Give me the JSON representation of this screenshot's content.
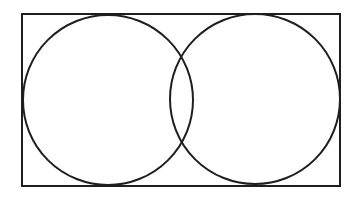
{
  "diagram": {
    "type": "venn",
    "stroke_color": "#1e1e1e",
    "background": "#ffffff",
    "frame": {
      "x": 22,
      "y": 14,
      "width": 318,
      "height": 172
    },
    "circles": [
      {
        "id": "left",
        "cx": 108,
        "cy": 100,
        "r": 85
      },
      {
        "id": "right",
        "cx": 255,
        "cy": 99,
        "r": 85
      }
    ]
  }
}
